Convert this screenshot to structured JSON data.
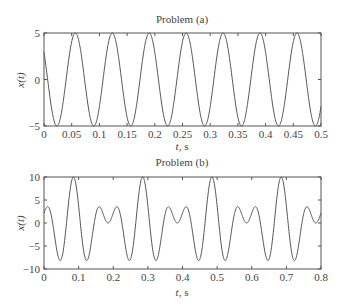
{
  "chart_data": [
    {
      "type": "line",
      "title": "Problem (a)",
      "xlabel": "t, s",
      "ylabel": "x(t)",
      "xlim": [
        0,
        0.5
      ],
      "ylim": [
        -5,
        5
      ],
      "xticks": [
        "0",
        "0.05",
        "0.1",
        "0.15",
        "0.2",
        "0.25",
        "0.3",
        "0.35",
        "0.4",
        "0.45",
        "0.5"
      ],
      "yticks": [
        "5",
        "0",
        "−5"
      ],
      "grid": false,
      "series": [
        {
          "name": "x(t)",
          "formula": "5cos(2π·15t + 0.95)",
          "amplitude": 5,
          "frequency_hz": 15,
          "phase_rad": 0.95,
          "key_points": [
            [
              0,
              2.9
            ],
            [
              0.023,
              -5
            ],
            [
              0.057,
              5
            ],
            [
              0.09,
              -5
            ],
            [
              0.123,
              5
            ],
            [
              0.157,
              -5
            ],
            [
              0.19,
              5
            ],
            [
              0.223,
              -5
            ],
            [
              0.257,
              5
            ],
            [
              0.29,
              -5
            ],
            [
              0.323,
              5
            ],
            [
              0.357,
              -5
            ],
            [
              0.39,
              5
            ],
            [
              0.423,
              -5
            ],
            [
              0.457,
              5
            ],
            [
              0.49,
              -5
            ],
            [
              0.5,
              -3.5
            ]
          ]
        }
      ]
    },
    {
      "type": "line",
      "title": "Problem (b)",
      "xlabel": "t, s",
      "ylabel": "x(t)",
      "xlim": [
        0,
        0.8
      ],
      "ylim": [
        -10,
        10
      ],
      "xticks": [
        "0",
        "0.1",
        "0.2",
        "0.3",
        "0.4",
        "0.5",
        "0.6",
        "0.7",
        "0.8"
      ],
      "yticks": [
        "10",
        "5",
        "0",
        "−5",
        "−10"
      ],
      "grid": false,
      "series": [
        {
          "name": "x(t)",
          "formula": "5cos(2π·10(t−0.085)) + 5cos(2π·15(t−0.085))",
          "components": [
            {
              "amplitude": 5,
              "frequency_hz": 10
            },
            {
              "amplitude": 5,
              "frequency_hz": 15
            }
          ],
          "shift_s": 0.085,
          "key_points": [
            [
              0,
              3
            ],
            [
              0.01,
              4
            ],
            [
              0.045,
              -8.5
            ],
            [
              0.085,
              10
            ],
            [
              0.125,
              -8
            ],
            [
              0.162,
              3
            ],
            [
              0.185,
              0
            ],
            [
              0.21,
              4
            ],
            [
              0.245,
              -8.5
            ],
            [
              0.285,
              10
            ],
            [
              0.325,
              -8
            ],
            [
              0.36,
              3
            ],
            [
              0.385,
              0
            ],
            [
              0.41,
              4
            ],
            [
              0.445,
              -8.5
            ],
            [
              0.485,
              10
            ],
            [
              0.525,
              -8
            ],
            [
              0.56,
              3
            ],
            [
              0.585,
              0
            ],
            [
              0.61,
              4
            ],
            [
              0.645,
              -8.5
            ],
            [
              0.685,
              10
            ],
            [
              0.725,
              -8
            ],
            [
              0.76,
              3
            ],
            [
              0.785,
              0
            ],
            [
              0.8,
              2.5
            ]
          ]
        }
      ]
    }
  ],
  "plots": {
    "a": {
      "title": "Problem (a)",
      "xlabel_var": "t",
      "xlabel_unit": ", s",
      "ylabel": "x(t)"
    },
    "b": {
      "title": "Problem (b)",
      "xlabel_var": "t",
      "xlabel_unit": ", s",
      "ylabel": "x(t)"
    }
  },
  "style": {
    "line_color": "#555555",
    "axis_color": "#555555"
  }
}
